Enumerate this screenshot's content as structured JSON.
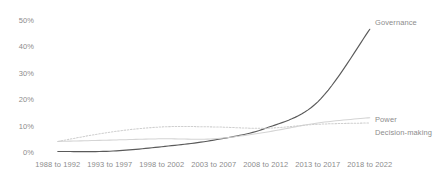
{
  "chart_data": {
    "type": "line",
    "title": "",
    "xlabel": "",
    "ylabel": "",
    "categories": [
      "1988 to 1992",
      "1993 to 1997",
      "1998 to 2002",
      "2003 to 2007",
      "2008 to 2012",
      "2013 to 2017",
      "2018 to 2022"
    ],
    "yticks": [
      "0%",
      "10%",
      "20%",
      "30%",
      "40%",
      "50%"
    ],
    "ytick_values": [
      0,
      10,
      20,
      30,
      40,
      50
    ],
    "ylim": [
      0,
      50
    ],
    "grid": false,
    "legend_position": "right-inline",
    "series": [
      {
        "name": "Governance",
        "color": "#5a5a5a",
        "style": "solid",
        "values": [
          0.2,
          0.3,
          2.0,
          4.5,
          9.0,
          19.0,
          46.5
        ]
      },
      {
        "name": "Power",
        "color": "#d4d4d4",
        "style": "solid",
        "values": [
          4.0,
          4.5,
          5.0,
          5.0,
          7.5,
          11.0,
          13.0
        ]
      },
      {
        "name": "Decision-making",
        "color": "#cfcfcf",
        "style": "dotted",
        "values": [
          4.0,
          7.5,
          9.5,
          9.5,
          9.0,
          10.5,
          11.0
        ]
      }
    ]
  },
  "axis": {
    "y_labels": [
      "50%",
      "40%",
      "30%",
      "20%",
      "10%",
      "0%"
    ],
    "x_labels": [
      "1988 to 1992",
      "1993 to 1997",
      "1998 to 2002",
      "2003 to 2007",
      "2008 to 2012",
      "2013 to 2017",
      "2018 to 2022"
    ]
  },
  "series_labels": {
    "governance": "Governance",
    "power": "Power",
    "decision_making": "Decision-making"
  },
  "colors": {
    "governance": "#5a5a5a",
    "power": "#d4d4d4",
    "decision_making": "#cfcfcf",
    "axis_text": "#8c8c8c",
    "background": "#ffffff"
  }
}
